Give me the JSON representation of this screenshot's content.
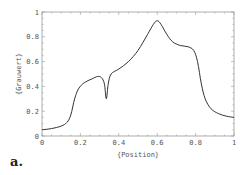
{
  "chart_data": {
    "type": "line",
    "title": "",
    "xlabel": "{Position}",
    "ylabel": "{Grauwert}",
    "xlim": [
      0,
      1
    ],
    "ylim": [
      0,
      1
    ],
    "grid": false,
    "legend": null,
    "x_ticks": [
      "0",
      "0.2",
      "0.4",
      "0.6",
      "0.8",
      "1"
    ],
    "y_ticks": [
      "0",
      "0.2",
      "0.4",
      "0.6",
      "0.8",
      "1"
    ],
    "series": [
      {
        "name": "Grauwert",
        "color": "#333333",
        "x": [
          0.0,
          0.05,
          0.1,
          0.13,
          0.15,
          0.17,
          0.19,
          0.22,
          0.26,
          0.29,
          0.31,
          0.325,
          0.335,
          0.345,
          0.36,
          0.4,
          0.45,
          0.5,
          0.55,
          0.58,
          0.6,
          0.62,
          0.65,
          0.68,
          0.72,
          0.76,
          0.79,
          0.81,
          0.83,
          0.85,
          0.88,
          0.92,
          0.96,
          1.0
        ],
        "y": [
          0.05,
          0.06,
          0.08,
          0.11,
          0.17,
          0.3,
          0.38,
          0.43,
          0.46,
          0.48,
          0.47,
          0.42,
          0.3,
          0.42,
          0.5,
          0.54,
          0.6,
          0.69,
          0.82,
          0.9,
          0.93,
          0.9,
          0.82,
          0.76,
          0.73,
          0.72,
          0.69,
          0.6,
          0.42,
          0.3,
          0.22,
          0.18,
          0.16,
          0.15
        ]
      }
    ],
    "panel_label": "a."
  }
}
